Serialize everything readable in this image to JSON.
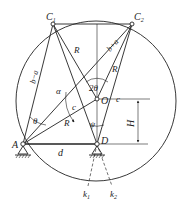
{
  "diagram": {
    "points": {
      "C1": {
        "label": "C",
        "sub": "1",
        "x": 53,
        "y": 24
      },
      "C2": {
        "label": "C",
        "sub": "2",
        "x": 132,
        "y": 24
      },
      "O": {
        "label": "O",
        "x": 97,
        "y": 99
      },
      "A": {
        "label": "A",
        "x": 23,
        "y": 144
      },
      "D": {
        "label": "D",
        "x": 97,
        "y": 144
      },
      "k1": {
        "label": "k",
        "sub": "1",
        "x": 87,
        "y": 192
      },
      "k2": {
        "label": "k",
        "sub": "2",
        "x": 113,
        "y": 192
      }
    },
    "labels": {
      "b_minus_a": "b−a",
      "b_plus_a": "b+a",
      "R_upper_left": "R",
      "R_upper_right": "R",
      "R_lower": "R",
      "alpha": "α",
      "two_theta": "2θ",
      "theta_upper": "θ",
      "theta_lower": "θ",
      "psi": "ψ",
      "c_left": "c",
      "c_right": "c",
      "d": "d",
      "H": "H"
    },
    "colors": {
      "stroke": "#222222",
      "background": "#ffffff"
    }
  }
}
